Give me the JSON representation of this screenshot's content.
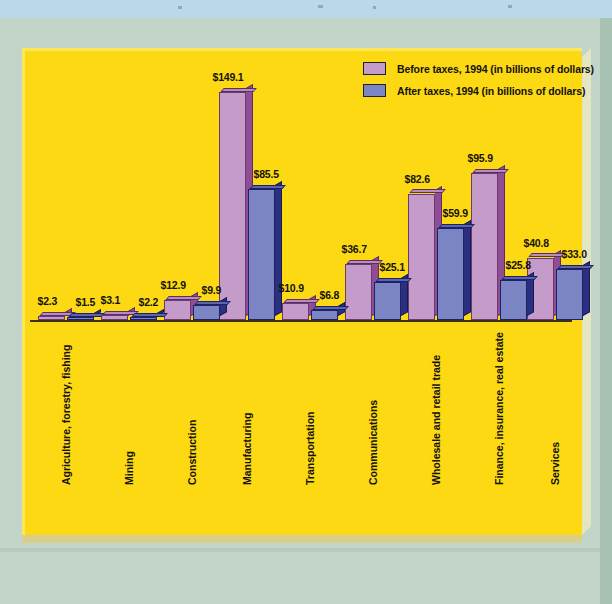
{
  "chart_data": {
    "type": "bar",
    "title": "",
    "xlabel": "",
    "ylabel": "",
    "grid": false,
    "legend_position": "top-right",
    "value_prefix": "$",
    "categories": [
      "Agriculture, forestry, fishing",
      "Mining",
      "Construction",
      "Manufacturing",
      "Transportation",
      "Communications",
      "Wholesale and retail trade",
      "Finance, insurance, real estate",
      "Services"
    ],
    "series": [
      {
        "name": "Before taxes, 1994 (in billions of dollars)",
        "color": "#c49bc9",
        "values": [
          2.3,
          3.1,
          12.9,
          149.1,
          10.9,
          36.7,
          82.6,
          95.9,
          40.8
        ],
        "labels": [
          "$2.3",
          "$3.1",
          "$12.9",
          "$149.1",
          "$10.9",
          "$36.7",
          "$82.6",
          "$95.9",
          "$40.8"
        ]
      },
      {
        "name": "After taxes, 1994 (in billions of dollars)",
        "color": "#7b85c4",
        "values": [
          1.5,
          2.2,
          9.9,
          85.5,
          6.8,
          25.1,
          59.9,
          25.8,
          33.0
        ],
        "labels": [
          "$1.5",
          "$2.2",
          "$9.9",
          "$85.5",
          "$6.8",
          "$25.1",
          "$59.9",
          "$25.8",
          "$33.0"
        ]
      }
    ],
    "ylim": [
      0,
      160
    ]
  },
  "legend": {
    "items": [
      {
        "label": "Before taxes, 1994 (in billions of dollars)",
        "swatch": "before"
      },
      {
        "label": "After taxes, 1994 (in billions of dollars)",
        "swatch": "after"
      }
    ]
  },
  "colors": {
    "panel": "#fcd913",
    "mat": "#c2d5c8",
    "backdrop": "#b9d8ea",
    "before_face": "#c49bc9",
    "before_side": "#8e4d95",
    "after_face": "#7b85c4",
    "after_side": "#2b2f80",
    "axis": "#3b2f10"
  }
}
